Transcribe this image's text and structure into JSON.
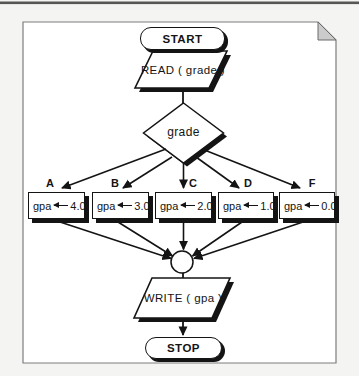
{
  "page": {
    "background": "#f4f4f2",
    "top_rule_color": "#565656",
    "border_color": "#7d7d7d",
    "fold_fill": "#cbcbcb",
    "paper_fill": "#ffffff"
  },
  "flowchart": {
    "ink_color": "#141414",
    "start": {
      "label": "START"
    },
    "read": {
      "label": "READ  ( grade )"
    },
    "decision": {
      "label": "grade"
    },
    "branches": [
      {
        "grade": "A",
        "assign_target": "gpa",
        "value": "4.0"
      },
      {
        "grade": "B",
        "assign_target": "gpa",
        "value": "3.0"
      },
      {
        "grade": "C",
        "assign_target": "gpa",
        "value": "2.0"
      },
      {
        "grade": "D",
        "assign_target": "gpa",
        "value": "1.0"
      },
      {
        "grade": "F",
        "assign_target": "gpa",
        "value": "0.0"
      }
    ],
    "write": {
      "label": "WRITE  ( gpa )"
    },
    "stop": {
      "label": "STOP"
    }
  }
}
